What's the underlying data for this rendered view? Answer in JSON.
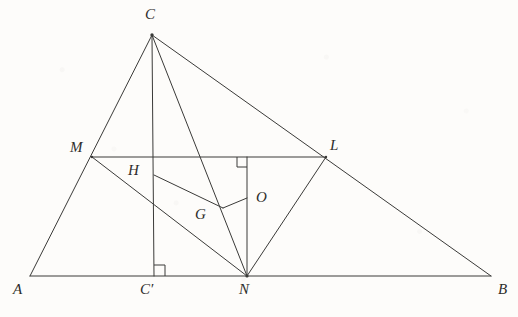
{
  "figure": {
    "kind": "euclidean-geometry-diagram",
    "width": 518,
    "height": 317,
    "background_color": "#fdfcfa",
    "stroke_color": "#3a3a38",
    "label_color": "#2e2d2b",
    "stroke_width": 1
  },
  "labels": {
    "A": "A",
    "B": "B",
    "C": "C",
    "C_prime": "C′",
    "M": "M",
    "N": "N",
    "L": "L",
    "H": "H",
    "G": "G",
    "O": "O"
  },
  "points": {
    "A": {
      "x": 30,
      "y": 276
    },
    "B": {
      "x": 491,
      "y": 276
    },
    "C": {
      "x": 152,
      "y": 35
    },
    "C_prime": {
      "x": 154,
      "y": 276
    },
    "M": {
      "x": 92,
      "y": 157
    },
    "N": {
      "x": 247,
      "y": 276
    },
    "L": {
      "x": 326,
      "y": 157
    },
    "H": {
      "x": 154,
      "y": 175
    },
    "G": {
      "x": 223,
      "y": 208
    },
    "O": {
      "x": 247,
      "y": 198
    }
  },
  "label_positions": {
    "A": {
      "x": 13,
      "y": 282
    },
    "B": {
      "x": 498,
      "y": 282
    },
    "C": {
      "x": 145,
      "y": 7
    },
    "C_prime": {
      "x": 140,
      "y": 282
    },
    "M": {
      "x": 70,
      "y": 140
    },
    "N": {
      "x": 239,
      "y": 282
    },
    "L": {
      "x": 330,
      "y": 138
    },
    "H": {
      "x": 128,
      "y": 163
    },
    "G": {
      "x": 195,
      "y": 207
    },
    "O": {
      "x": 256,
      "y": 190
    }
  },
  "segments": [
    {
      "name": "side-AB",
      "from": "A",
      "to": "B"
    },
    {
      "name": "side-AC",
      "from": "A",
      "to": "C"
    },
    {
      "name": "side-CB",
      "from": "C",
      "to": "B"
    },
    {
      "name": "altitude-CC-prime",
      "from": "C",
      "to": "C_prime"
    },
    {
      "name": "cevian-CN",
      "from": "C",
      "to": "N"
    },
    {
      "name": "midline-ML",
      "from": "M",
      "to": "L"
    },
    {
      "name": "segment-MN",
      "from": "M",
      "to": "N"
    },
    {
      "name": "segment-LN",
      "from": "L",
      "to": "N"
    },
    {
      "name": "perpendicular-ON",
      "from": "O_top",
      "to": "N"
    },
    {
      "name": "segment-HG",
      "from": "H",
      "to": "G"
    },
    {
      "name": "segment-GO",
      "from": "G",
      "to": "O"
    }
  ],
  "right_angle_marks": [
    {
      "name": "right-angle-at-C-prime",
      "vertex": "C_prime",
      "x": 154,
      "y": 276,
      "size": 11,
      "dir_x": 1,
      "dir_y": -1
    },
    {
      "name": "right-angle-at-ML-foot",
      "vertex": "ML-foot",
      "x": 247,
      "y": 157,
      "size": 10,
      "dir_x": -1,
      "dir_y": 1
    }
  ]
}
